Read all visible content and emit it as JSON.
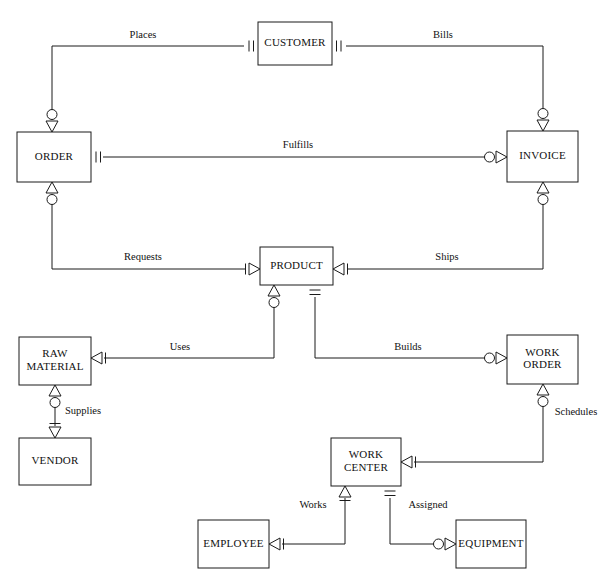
{
  "diagram": {
    "type": "entity-relationship-diagram",
    "notation": "crow's-foot",
    "background_color": "#ffffff",
    "line_color": "#1a1a1a",
    "text_color": "#111111",
    "width": 614,
    "height": 583,
    "entities": [
      {
        "id": "customer",
        "name": "CUSTOMER",
        "lines": [
          "CUSTOMER"
        ],
        "x": 258,
        "y": 22,
        "w": 74,
        "h": 43
      },
      {
        "id": "order",
        "name": "ORDER",
        "lines": [
          "ORDER"
        ],
        "x": 17,
        "y": 132,
        "w": 74,
        "h": 50
      },
      {
        "id": "invoice",
        "name": "INVOICE",
        "lines": [
          "INVOICE"
        ],
        "x": 507,
        "y": 131,
        "w": 71,
        "h": 51
      },
      {
        "id": "product",
        "name": "PRODUCT",
        "lines": [
          "PRODUCT"
        ],
        "x": 260,
        "y": 247,
        "w": 73,
        "h": 38
      },
      {
        "id": "raw-material",
        "name": "RAW MATERIAL",
        "lines": [
          "RAW",
          "MATERIAL"
        ],
        "x": 19,
        "y": 337,
        "w": 72,
        "h": 48
      },
      {
        "id": "vendor",
        "name": "VENDOR",
        "lines": [
          "VENDOR"
        ],
        "x": 19,
        "y": 438,
        "w": 72,
        "h": 47
      },
      {
        "id": "work-order",
        "name": "WORK ORDER",
        "lines": [
          "WORK",
          "ORDER"
        ],
        "x": 507,
        "y": 335,
        "w": 71,
        "h": 49
      },
      {
        "id": "work-center",
        "name": "WORK CENTER",
        "lines": [
          "WORK",
          "CENTER"
        ],
        "x": 331,
        "y": 438,
        "w": 70,
        "h": 48
      },
      {
        "id": "employee",
        "name": "EMPLOYEE",
        "lines": [
          "EMPLOYEE"
        ],
        "x": 198,
        "y": 520,
        "w": 71,
        "h": 48
      },
      {
        "id": "equipment",
        "name": "EQUIPMENT",
        "lines": [
          "EQUIPMENT"
        ],
        "x": 456,
        "y": 520,
        "w": 70,
        "h": 48
      }
    ],
    "relationships": [
      {
        "id": "places",
        "label": "Places",
        "from": "customer",
        "to": "order",
        "label_x": 143,
        "label_y": 36,
        "path": "M 244 46 L 52 46 L 52 120",
        "ends": [
          {
            "at": "customer-left",
            "x": 244,
            "y": 46,
            "dir": "right",
            "symbol": "one-and-only-one"
          },
          {
            "at": "order-top",
            "x": 52,
            "y": 132,
            "dir": "up",
            "symbol": "zero-or-many"
          }
        ]
      },
      {
        "id": "bills",
        "label": "Bills",
        "from": "customer",
        "to": "invoice",
        "label_x": 443,
        "label_y": 36,
        "path": "M 346 46 L 543 46 L 543 119",
        "ends": [
          {
            "at": "customer-right",
            "x": 346,
            "y": 46,
            "dir": "left",
            "symbol": "one-and-only-one"
          },
          {
            "at": "invoice-top",
            "x": 543,
            "y": 131,
            "dir": "up",
            "symbol": "zero-or-many"
          }
        ]
      },
      {
        "id": "fulfills",
        "label": "Fulfills",
        "from": "order",
        "to": "invoice",
        "label_x": 298,
        "label_y": 146,
        "path": "M 103 157 L 493 157",
        "ends": [
          {
            "at": "order-right",
            "x": 91,
            "y": 157,
            "dir": "right",
            "symbol": "one-and-only-one"
          },
          {
            "at": "invoice-left",
            "x": 507,
            "y": 157,
            "dir": "left",
            "symbol": "zero-or-many"
          }
        ]
      },
      {
        "id": "requests",
        "label": "Requests",
        "from": "order",
        "to": "product",
        "label_x": 143,
        "label_y": 258,
        "path": "M 52 194 L 52 269 L 246 269",
        "ends": [
          {
            "at": "order-bottom",
            "x": 52,
            "y": 182,
            "dir": "down",
            "symbol": "zero-or-many"
          },
          {
            "at": "product-left",
            "x": 260,
            "y": 269,
            "dir": "left",
            "symbol": "one-or-many"
          }
        ]
      },
      {
        "id": "ships",
        "label": "Ships",
        "from": "invoice",
        "to": "product",
        "label_x": 447,
        "label_y": 258,
        "path": "M 543 194 L 543 269 L 347 269",
        "ends": [
          {
            "at": "invoice-bottom",
            "x": 543,
            "y": 182,
            "dir": "down",
            "symbol": "zero-or-many"
          },
          {
            "at": "product-right",
            "x": 333,
            "y": 269,
            "dir": "right",
            "symbol": "one-or-many"
          }
        ]
      },
      {
        "id": "uses",
        "label": "Uses",
        "from": "product",
        "to": "raw-material",
        "label_x": 180,
        "label_y": 348,
        "path": "M 274 297 L 274 358 L 104 358",
        "ends": [
          {
            "at": "product-bottom-left",
            "x": 274,
            "y": 285,
            "dir": "down",
            "symbol": "zero-or-many"
          },
          {
            "at": "raw-material-right",
            "x": 91,
            "y": 358,
            "dir": "right",
            "symbol": "one-or-many"
          }
        ]
      },
      {
        "id": "builds",
        "label": "Builds",
        "from": "product",
        "to": "work-order",
        "label_x": 408,
        "label_y": 348,
        "path": "M 315 297 L 315 358 L 493 358",
        "ends": [
          {
            "at": "product-bottom-right",
            "x": 315,
            "y": 285,
            "dir": "down",
            "symbol": "one-and-only-one"
          },
          {
            "at": "work-order-left",
            "x": 507,
            "y": 358,
            "dir": "left",
            "symbol": "zero-or-many"
          }
        ]
      },
      {
        "id": "supplies",
        "label": "Supplies",
        "from": "raw-material",
        "to": "vendor",
        "label_x": 83,
        "label_y": 412,
        "path": "M 55 397 L 55 426",
        "ends": [
          {
            "at": "raw-material-bottom",
            "x": 55,
            "y": 385,
            "dir": "down",
            "symbol": "zero-or-many"
          },
          {
            "at": "vendor-top",
            "x": 55,
            "y": 438,
            "dir": "up",
            "symbol": "one-or-many"
          }
        ]
      },
      {
        "id": "schedules",
        "label": "Schedules",
        "from": "work-order",
        "to": "work-center",
        "label_x": 576,
        "label_y": 413,
        "path": "M 543 396 L 543 462 L 414 462",
        "ends": [
          {
            "at": "work-order-bottom",
            "x": 543,
            "y": 384,
            "dir": "down",
            "symbol": "zero-or-many"
          },
          {
            "at": "work-center-right",
            "x": 401,
            "y": 462,
            "dir": "right",
            "symbol": "one-or-many"
          }
        ]
      },
      {
        "id": "works",
        "label": "Works",
        "from": "work-center",
        "to": "employee",
        "label_x": 313,
        "label_y": 506,
        "path": "M 345 498 L 345 544 L 282 544",
        "ends": [
          {
            "at": "work-center-bottom-left",
            "x": 345,
            "y": 486,
            "dir": "down",
            "symbol": "one-or-many"
          },
          {
            "at": "employee-right",
            "x": 269,
            "y": 544,
            "dir": "right",
            "symbol": "one-or-many"
          }
        ]
      },
      {
        "id": "assigned",
        "label": "Assigned",
        "from": "work-center",
        "to": "equipment",
        "label_x": 428,
        "label_y": 506,
        "path": "M 390 498 L 390 544 L 442 544",
        "ends": [
          {
            "at": "work-center-bottom-right",
            "x": 390,
            "y": 486,
            "dir": "down",
            "symbol": "one-and-only-one"
          },
          {
            "at": "equipment-left",
            "x": 456,
            "y": 544,
            "dir": "left",
            "symbol": "zero-or-many"
          }
        ]
      }
    ],
    "legend": {
      "symbols": [
        {
          "key": "one-and-only-one",
          "meaning": "one and only one"
        },
        {
          "key": "one-or-many",
          "meaning": "one or many"
        },
        {
          "key": "zero-or-many",
          "meaning": "zero or many"
        }
      ]
    }
  }
}
